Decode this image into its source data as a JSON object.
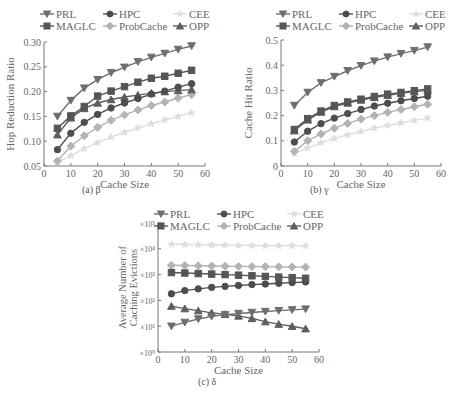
{
  "figure": {
    "legend": [
      "PRL",
      "HPC",
      "CEE",
      "MAGLC",
      "ProbCache",
      "OPP"
    ]
  },
  "styles": {
    "PRL": {
      "color": "#6e6e6e",
      "marker": "triangle-down"
    },
    "MAGLC": {
      "color": "#555555",
      "marker": "square"
    },
    "HPC": {
      "color": "#4d4d4d",
      "marker": "circle"
    },
    "ProbCache": {
      "color": "#b3b3b3",
      "marker": "diamond"
    },
    "CEE": {
      "color": "#dedede",
      "marker": "star"
    },
    "OPP": {
      "color": "#5e5e5e",
      "marker": "triangle-up"
    }
  },
  "captions": {
    "a": "(a) β",
    "b": "(b) γ",
    "c": "(c) δ"
  },
  "chart_data": [
    {
      "id": "a",
      "type": "line",
      "title": "",
      "caption": "(a) β",
      "xlabel": "Cache Size",
      "ylabel": "Hop Reduction Ratio",
      "xlim": [
        0,
        60
      ],
      "ylim": [
        0.05,
        0.3
      ],
      "xticks": [
        0,
        10,
        20,
        30,
        40,
        50,
        60
      ],
      "yticks": [
        0.05,
        0.1,
        0.15,
        0.2,
        0.25,
        0.3
      ],
      "ytick_labels": [
        "0.05",
        "0.10",
        "0.15",
        "0.20",
        "0.25",
        "0.30"
      ],
      "yscale": "linear",
      "grid": false,
      "legend_position": "top",
      "x": [
        5,
        10,
        15,
        20,
        25,
        30,
        35,
        40,
        45,
        50,
        55
      ],
      "series": [
        {
          "name": "PRL",
          "values": [
            0.15,
            0.182,
            0.207,
            0.224,
            0.238,
            0.249,
            0.26,
            0.269,
            0.277,
            0.285,
            0.292
          ]
        },
        {
          "name": "MAGLC",
          "values": [
            0.126,
            0.151,
            0.17,
            0.191,
            0.201,
            0.21,
            0.219,
            0.227,
            0.231,
            0.237,
            0.243
          ]
        },
        {
          "name": "HPC",
          "values": [
            0.083,
            0.116,
            0.138,
            0.154,
            0.167,
            0.177,
            0.186,
            0.195,
            0.201,
            0.209,
            0.216
          ]
        },
        {
          "name": "OPP",
          "values": [
            0.113,
            0.147,
            0.166,
            0.177,
            0.184,
            0.189,
            0.193,
            0.197,
            0.2,
            0.202,
            0.204
          ]
        },
        {
          "name": "ProbCache",
          "values": [
            0.06,
            0.09,
            0.111,
            0.128,
            0.142,
            0.153,
            0.163,
            0.172,
            0.179,
            0.187,
            0.194
          ]
        },
        {
          "name": "CEE",
          "values": [
            0.058,
            0.071,
            0.085,
            0.097,
            0.108,
            0.118,
            0.127,
            0.135,
            0.143,
            0.15,
            0.157
          ]
        }
      ]
    },
    {
      "id": "b",
      "type": "line",
      "title": "",
      "caption": "(b) γ",
      "xlabel": "Cache Size",
      "ylabel": "Cache Hit Ratio",
      "xlim": [
        0,
        60
      ],
      "ylim": [
        0,
        0.5
      ],
      "xticks": [
        0,
        10,
        20,
        30,
        40,
        50,
        60
      ],
      "yticks": [
        0,
        0.1,
        0.2,
        0.3,
        0.4,
        0.5
      ],
      "ytick_labels": [
        "0",
        "0.1",
        "0.2",
        "0.3",
        "0.4",
        "0.5"
      ],
      "yscale": "linear",
      "grid": false,
      "legend_position": "top",
      "x": [
        5,
        10,
        15,
        20,
        25,
        30,
        35,
        40,
        45,
        50,
        55
      ],
      "series": [
        {
          "name": "PRL",
          "values": [
            0.24,
            0.292,
            0.33,
            0.355,
            0.378,
            0.398,
            0.416,
            0.432,
            0.446,
            0.458,
            0.472
          ]
        },
        {
          "name": "MAGLC",
          "values": [
            0.145,
            0.188,
            0.218,
            0.24,
            0.254,
            0.265,
            0.276,
            0.285,
            0.292,
            0.299,
            0.306
          ]
        },
        {
          "name": "OPP",
          "values": [
            0.14,
            0.183,
            0.214,
            0.236,
            0.25,
            0.262,
            0.272,
            0.281,
            0.288,
            0.295,
            0.3
          ]
        },
        {
          "name": "HPC",
          "values": [
            0.095,
            0.138,
            0.168,
            0.19,
            0.208,
            0.224,
            0.238,
            0.249,
            0.259,
            0.268,
            0.277
          ]
        },
        {
          "name": "ProbCache",
          "values": [
            0.058,
            0.1,
            0.127,
            0.15,
            0.169,
            0.186,
            0.2,
            0.213,
            0.224,
            0.235,
            0.245
          ]
        },
        {
          "name": "CEE",
          "values": [
            0.05,
            0.072,
            0.092,
            0.109,
            0.124,
            0.137,
            0.15,
            0.161,
            0.171,
            0.181,
            0.19
          ]
        }
      ]
    },
    {
      "id": "c",
      "type": "line",
      "title": "",
      "caption": "(c) δ",
      "xlabel": "Cache Size",
      "ylabel": "Average Number of Caching Evictions",
      "xlim": [
        0,
        60
      ],
      "ylim": [
        1,
        100000
      ],
      "xticks": [
        0,
        10,
        20,
        30,
        40,
        50,
        60
      ],
      "yticks": [
        1,
        10,
        100,
        1000,
        10000,
        100000
      ],
      "ytick_labels": [
        "×10⁰",
        "×10¹",
        "×10²",
        "×10³",
        "×10⁴",
        "×10⁵"
      ],
      "yscale": "log",
      "grid": false,
      "legend_position": "top",
      "x": [
        5,
        10,
        15,
        20,
        25,
        30,
        35,
        40,
        45,
        50,
        55
      ],
      "series": [
        {
          "name": "CEE",
          "values": [
            15000,
            14500,
            14200,
            14000,
            13800,
            13600,
            13400,
            13200,
            13100,
            13000,
            12900
          ]
        },
        {
          "name": "ProbCache",
          "values": [
            2300,
            2250,
            2200,
            2150,
            2100,
            2080,
            2050,
            2030,
            2000,
            1980,
            1950
          ]
        },
        {
          "name": "MAGLC",
          "values": [
            1200,
            1150,
            1100,
            1050,
            1000,
            950,
            900,
            850,
            800,
            760,
            720
          ]
        },
        {
          "name": "HPC",
          "values": [
            180,
            240,
            280,
            320,
            350,
            380,
            410,
            430,
            460,
            490,
            520
          ]
        },
        {
          "name": "OPP",
          "values": [
            60,
            48,
            40,
            33,
            29,
            25,
            20,
            15,
            12,
            10,
            8
          ]
        },
        {
          "name": "PRL",
          "values": [
            10,
            14,
            19,
            24,
            28,
            31,
            34,
            37,
            40,
            43,
            46
          ]
        }
      ]
    }
  ]
}
